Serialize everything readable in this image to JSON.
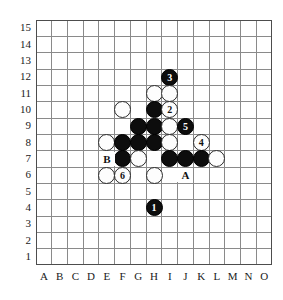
{
  "board": {
    "title": "Go board diagram",
    "size_cols": 15,
    "size_rows": 15,
    "column_labels": [
      "A",
      "B",
      "C",
      "D",
      "E",
      "F",
      "G",
      "H",
      "I",
      "J",
      "K",
      "L",
      "M",
      "N",
      "O"
    ],
    "row_labels": [
      "15",
      "14",
      "13",
      "12",
      "11",
      "10",
      "9",
      "8",
      "7",
      "6",
      "5",
      "4",
      "3",
      "2",
      "1"
    ],
    "grid_color": "#808080",
    "border_color": "#4d4d4d",
    "background_color": "#ffffff",
    "black_color": "#0d0d0d",
    "white_color": "#fdfdfd",
    "label_color": "#1a1a1a"
  },
  "stones": [
    {
      "id": "stone-i12-black-3",
      "col": "I",
      "row": 12,
      "color": "black",
      "number": "3"
    },
    {
      "id": "stone-h11-white",
      "col": "H",
      "row": 11,
      "color": "white",
      "number": ""
    },
    {
      "id": "stone-i11-white",
      "col": "I",
      "row": 11,
      "color": "white",
      "number": ""
    },
    {
      "id": "stone-f10-white",
      "col": "F",
      "row": 10,
      "color": "white",
      "number": ""
    },
    {
      "id": "stone-h10-black",
      "col": "H",
      "row": 10,
      "color": "black",
      "number": ""
    },
    {
      "id": "stone-i10-white-2",
      "col": "I",
      "row": 10,
      "color": "white",
      "number": "2"
    },
    {
      "id": "stone-g9-black",
      "col": "G",
      "row": 9,
      "color": "black",
      "number": ""
    },
    {
      "id": "stone-h9-black",
      "col": "H",
      "row": 9,
      "color": "black",
      "number": ""
    },
    {
      "id": "stone-i9-white",
      "col": "I",
      "row": 9,
      "color": "white",
      "number": ""
    },
    {
      "id": "stone-j9-black-5",
      "col": "J",
      "row": 9,
      "color": "black",
      "number": "5"
    },
    {
      "id": "stone-e8-white",
      "col": "E",
      "row": 8,
      "color": "white",
      "number": ""
    },
    {
      "id": "stone-f8-black",
      "col": "F",
      "row": 8,
      "color": "black",
      "number": ""
    },
    {
      "id": "stone-g8-black",
      "col": "G",
      "row": 8,
      "color": "black",
      "number": ""
    },
    {
      "id": "stone-h8-black",
      "col": "H",
      "row": 8,
      "color": "black",
      "number": ""
    },
    {
      "id": "stone-i8-white",
      "col": "I",
      "row": 8,
      "color": "white",
      "number": ""
    },
    {
      "id": "stone-k8-white-4",
      "col": "K",
      "row": 8,
      "color": "white",
      "number": "4"
    },
    {
      "id": "stone-f7-black",
      "col": "F",
      "row": 7,
      "color": "black",
      "number": ""
    },
    {
      "id": "stone-g7-white",
      "col": "G",
      "row": 7,
      "color": "white",
      "number": ""
    },
    {
      "id": "stone-i7-black",
      "col": "I",
      "row": 7,
      "color": "black",
      "number": ""
    },
    {
      "id": "stone-j7-black",
      "col": "J",
      "row": 7,
      "color": "black",
      "number": ""
    },
    {
      "id": "stone-k7-black",
      "col": "K",
      "row": 7,
      "color": "black",
      "number": ""
    },
    {
      "id": "stone-l7-white",
      "col": "L",
      "row": 7,
      "color": "white",
      "number": ""
    },
    {
      "id": "stone-e6-white",
      "col": "E",
      "row": 6,
      "color": "white",
      "number": ""
    },
    {
      "id": "stone-f6-white-6",
      "col": "F",
      "row": 6,
      "color": "white",
      "number": "6"
    },
    {
      "id": "stone-h6-white",
      "col": "H",
      "row": 6,
      "color": "white",
      "number": ""
    },
    {
      "id": "stone-h4-black-1",
      "col": "H",
      "row": 4,
      "color": "black",
      "number": "1"
    }
  ],
  "point_markers": [
    {
      "id": "marker-a",
      "label": "A",
      "col": "J",
      "row": 6
    },
    {
      "id": "marker-b",
      "label": "B",
      "col": "E",
      "row": 7
    }
  ]
}
